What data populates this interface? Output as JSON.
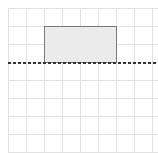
{
  "grid": {
    "origin_x": 8,
    "origin_y": 8,
    "spacing": 18,
    "cols": 8,
    "rows": 8,
    "line_color": "#e2e2e2"
  },
  "rectangle": {
    "x": 44,
    "y": 26,
    "width": 72,
    "height": 36,
    "fill": "#ebebeb",
    "stroke": "#7a7a7a"
  },
  "dashed_line": {
    "y": 63,
    "x1": 8,
    "x2": 158,
    "color": "#333333",
    "dash": "3,2"
  }
}
